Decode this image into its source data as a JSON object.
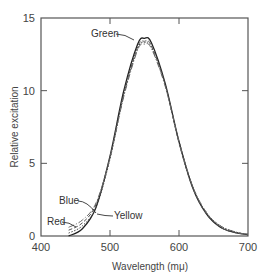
{
  "chart_data": {
    "type": "line",
    "title": "",
    "xlabel": "Wavelength (mμ)",
    "ylabel": "Relative excitation",
    "xlim": [
      400,
      700
    ],
    "ylim": [
      0,
      15
    ],
    "x_ticks": [
      400,
      500,
      600,
      700
    ],
    "y_ticks": [
      0,
      5,
      10,
      15
    ],
    "x_tick_labels": [
      "400",
      "500",
      "600",
      "700"
    ],
    "y_tick_labels": [
      "0",
      "5",
      "10",
      "15"
    ],
    "grid": false,
    "legend": null,
    "x": [
      440,
      460,
      480,
      500,
      520,
      540,
      550,
      560,
      580,
      600,
      620,
      640,
      660,
      680,
      700
    ],
    "series": [
      {
        "name": "Green",
        "values": [
          0.0,
          0.5,
          2.0,
          5.5,
          10.0,
          13.2,
          13.6,
          13.3,
          10.5,
          6.5,
          3.3,
          1.5,
          0.6,
          0.25,
          0.1
        ]
      },
      {
        "name": "Blue",
        "values": [
          0.4,
          0.9,
          2.2,
          5.4,
          9.8,
          13.0,
          13.4,
          13.1,
          10.4,
          6.4,
          3.3,
          1.5,
          0.6,
          0.25,
          0.1
        ]
      },
      {
        "name": "Yellow",
        "values": [
          0.2,
          0.7,
          2.0,
          5.3,
          9.7,
          12.9,
          13.3,
          13.0,
          10.4,
          6.5,
          3.4,
          1.6,
          0.7,
          0.3,
          0.1
        ]
      },
      {
        "name": "Red",
        "values": [
          0.6,
          1.1,
          2.3,
          5.4,
          9.6,
          12.8,
          13.2,
          12.9,
          10.3,
          6.5,
          3.4,
          1.6,
          0.7,
          0.3,
          0.1
        ]
      }
    ],
    "annotations": [
      {
        "text": "Green",
        "x": 530,
        "y": 13.4
      },
      {
        "text": "Blue",
        "x": 460,
        "y": 2.8
      },
      {
        "text": "Yellow",
        "x": 490,
        "y": 1.0
      },
      {
        "text": "Red",
        "x": 440,
        "y": 1.2
      }
    ]
  }
}
